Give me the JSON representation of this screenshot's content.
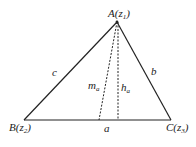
{
  "diagram": {
    "type": "triangle",
    "vertices": {
      "A": {
        "label": "A",
        "sub": "1",
        "var": "z",
        "x": 117,
        "y": 22
      },
      "B": {
        "label": "B",
        "sub": "2",
        "var": "z",
        "x": 24,
        "y": 120
      },
      "C": {
        "label": "C",
        "sub": "3",
        "var": "z",
        "x": 171,
        "y": 120
      }
    },
    "sides": {
      "a": {
        "label": "a"
      },
      "b": {
        "label": "b"
      },
      "c": {
        "label": "c"
      }
    },
    "segments": {
      "median": {
        "label": "m",
        "sub": "a",
        "style": "dashed"
      },
      "altitude": {
        "label": "h",
        "sub": "a",
        "style": "dashed"
      }
    },
    "colors": {
      "stroke": "#222222",
      "background": "#ffffff"
    }
  }
}
